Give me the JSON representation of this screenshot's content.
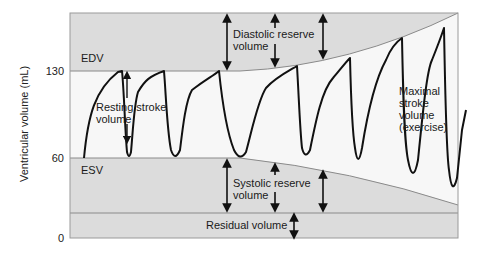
{
  "diagram": {
    "y_axis": {
      "label": "Ventricular volume (mL)",
      "ticks": [
        {
          "value": "130",
          "y": 71
        },
        {
          "value": "60",
          "y": 158
        },
        {
          "value": "0",
          "y": 238
        }
      ]
    },
    "regions": {
      "edv_label": "EDV",
      "esv_label": "ESV"
    },
    "annotations": {
      "resting_stroke_volume": [
        "Resting stroke",
        "volume"
      ],
      "diastolic_reserve_volume": [
        "Diastolic reserve",
        "volume"
      ],
      "systolic_reserve_volume": [
        "Systolic reserve",
        "volume"
      ],
      "residual_volume": "Residual volume",
      "maximal_stroke_volume": [
        "Maximal",
        "stroke",
        "volume",
        "(exercise)"
      ]
    },
    "colors": {
      "shaded_region": "#dcdcdc",
      "unshaded_region": "#f6f6f6",
      "curve": "#111111",
      "boundary_line": "#8a8a8a"
    }
  }
}
